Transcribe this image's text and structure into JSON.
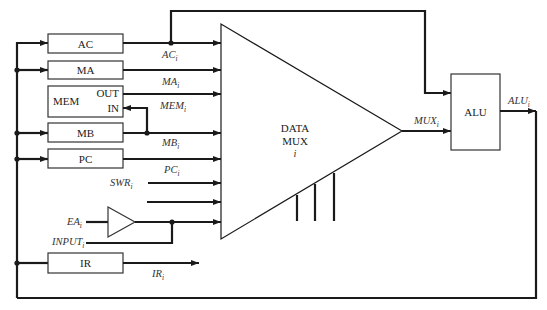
{
  "diagram": {
    "registers": [
      {
        "id": "ac",
        "label": "AC",
        "signal": "AC",
        "sub": "i"
      },
      {
        "id": "ma",
        "label": "MA",
        "signal": "MA",
        "sub": "i"
      },
      {
        "id": "mb",
        "label": "MB",
        "signal": "MB",
        "sub": "i"
      },
      {
        "id": "pc",
        "label": "PC",
        "signal": "PC",
        "sub": "i"
      },
      {
        "id": "ir",
        "label": "IR",
        "signal": "IR",
        "sub": "i"
      }
    ],
    "memory": {
      "label": "MEM",
      "out_label": "OUT",
      "in_label": "IN",
      "signal": "MEM",
      "sub": "i"
    },
    "mux": {
      "line1": "DATA",
      "line2": "MUX",
      "line3": "i",
      "output_signal": "MUX",
      "output_sub": "i"
    },
    "alu": {
      "label": "ALU",
      "output_signal": "ALU",
      "output_sub": "i"
    },
    "inputs": {
      "swr": {
        "signal": "SWR",
        "sub": "i"
      },
      "ea": {
        "signal": "EA",
        "sub": "i"
      },
      "input": {
        "signal": "INPUT",
        "sub": "i"
      }
    }
  }
}
